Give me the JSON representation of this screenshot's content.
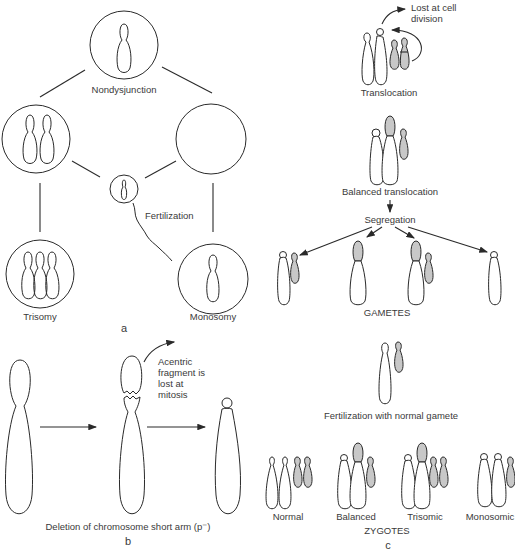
{
  "figure": {
    "panels": [
      {
        "id": "a",
        "label": "a"
      },
      {
        "id": "b",
        "label": "b"
      },
      {
        "id": "c",
        "label": "c"
      }
    ]
  },
  "panel_a": {
    "section_label": "a",
    "nondisjunction_label": "Nondysjunction",
    "fertilization_label": "Fertilization",
    "trisomy_label": "Trisomy",
    "monosomy_label": "Monosomy"
  },
  "panel_b": {
    "section_label": "b",
    "acentric_label_line1": "Acentric",
    "acentric_label_line2": "fragment is",
    "acentric_label_line3": "lost at",
    "acentric_label_line4": "mitosis",
    "caption": "Deletion of chromosome short arm (p⁻)"
  },
  "panel_c": {
    "section_label": "c",
    "lost_label_line1": "Lost at cell",
    "lost_label_line2": "division",
    "translocation_label": "Translocation",
    "balanced_translocation_label": "Balanced translocation",
    "segregation_label": "Segregation",
    "gametes_label": "GAMETES",
    "fertilization_label": "Fertilization with normal gamete",
    "zygote_types": [
      "Normal",
      "Balanced",
      "Trisomic",
      "Monosomic"
    ],
    "zygotes_label": "ZYGOTES"
  },
  "colors": {
    "stroke": "#2a2a2a",
    "translocated_fill": "#c8c8c8",
    "background": "#ffffff"
  }
}
